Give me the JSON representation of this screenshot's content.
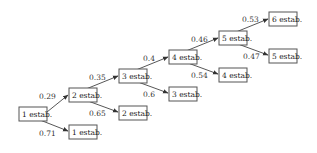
{
  "diagram": {
    "type": "probability-tree",
    "nodes": [
      {
        "id": "n1",
        "label": "1 estab.",
        "x": 19,
        "y": 108
      },
      {
        "id": "n2",
        "label": "2 estab.",
        "x": 69,
        "y": 89
      },
      {
        "id": "n1b",
        "label": "1 estab.",
        "x": 69,
        "y": 127
      },
      {
        "id": "n3",
        "label": "3 estab.",
        "x": 119,
        "y": 70
      },
      {
        "id": "n2b",
        "label": "2 estab.",
        "x": 119,
        "y": 108
      },
      {
        "id": "n4",
        "label": "4 estab.",
        "x": 169,
        "y": 51
      },
      {
        "id": "n3b",
        "label": "3 estab.",
        "x": 169,
        "y": 89
      },
      {
        "id": "n5",
        "label": "5 estab.",
        "x": 219,
        "y": 32
      },
      {
        "id": "n4b",
        "label": "4 estab.",
        "x": 219,
        "y": 70
      },
      {
        "id": "n6",
        "label": "6 estab.",
        "x": 269,
        "y": 13
      },
      {
        "id": "n5b",
        "label": "5 estab.",
        "x": 269,
        "y": 51
      }
    ],
    "edges": [
      {
        "from": "n1",
        "to": "n2",
        "prob": "0.29"
      },
      {
        "from": "n1",
        "to": "n1b",
        "prob": "0.71"
      },
      {
        "from": "n2",
        "to": "n3",
        "prob": "0.35"
      },
      {
        "from": "n2",
        "to": "n2b",
        "prob": "0.65"
      },
      {
        "from": "n3",
        "to": "n4",
        "prob": "0.4"
      },
      {
        "from": "n3",
        "to": "n3b",
        "prob": "0.6"
      },
      {
        "from": "n4",
        "to": "n5",
        "prob": "0.46"
      },
      {
        "from": "n4",
        "to": "n4b",
        "prob": "0.54"
      },
      {
        "from": "n5",
        "to": "n6",
        "prob": "0.53"
      },
      {
        "from": "n5",
        "to": "n5b",
        "prob": "0.47"
      }
    ]
  }
}
